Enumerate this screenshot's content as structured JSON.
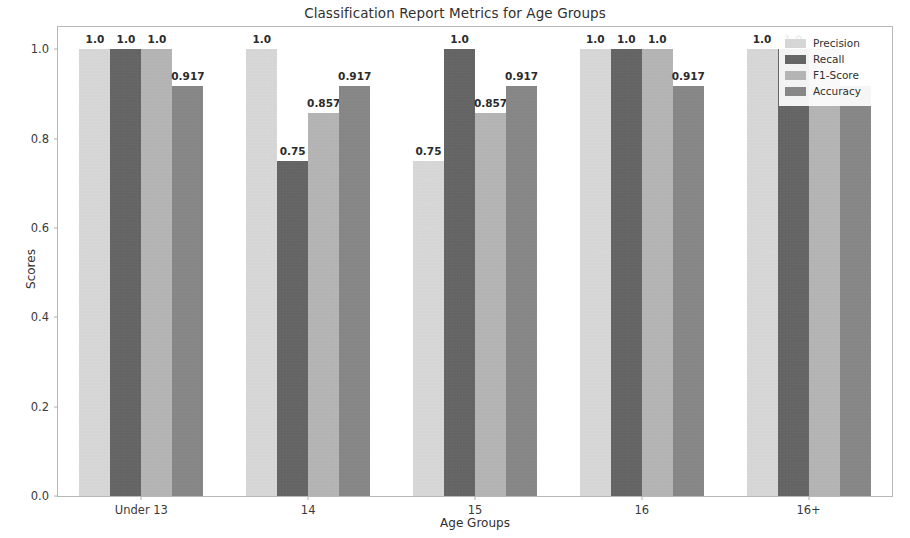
{
  "chart_data": {
    "type": "bar",
    "title": "Classification Report Metrics for Age Groups",
    "xlabel": "Age Groups",
    "ylabel": "Scores",
    "categories": [
      "Under 13",
      "14",
      "15",
      "16",
      "16+"
    ],
    "ylim": [
      0.0,
      1.05
    ],
    "yticks": [
      "0.0",
      "0.2",
      "0.4",
      "0.6",
      "0.8",
      "1.0"
    ],
    "ytick_values": [
      0.0,
      0.2,
      0.4,
      0.6,
      0.8,
      1.0
    ],
    "grid": false,
    "legend_position": "upper right",
    "series": [
      {
        "name": "Precision",
        "color": "#dcdcdc",
        "values": [
          1.0,
          1.0,
          0.75,
          1.0,
          1.0
        ],
        "labels": [
          "1.0",
          "1.0",
          "0.75",
          "1.0",
          "1.0"
        ]
      },
      {
        "name": "Recall",
        "color": "#595959",
        "values": [
          1.0,
          0.75,
          1.0,
          1.0,
          1.0
        ],
        "labels": [
          "1.0",
          "0.75",
          "1.0",
          "1.0",
          "1.0"
        ]
      },
      {
        "name": "F1-Score",
        "color": "#b4b4b4",
        "values": [
          1.0,
          0.857,
          0.857,
          1.0,
          1.0
        ],
        "labels": [
          "1.0",
          "0.857",
          "0.857",
          "1.0",
          ""
        ]
      },
      {
        "name": "Accuracy",
        "color": "#808080",
        "values": [
          0.917,
          0.917,
          0.917,
          0.917,
          0.917
        ],
        "labels": [
          "0.917",
          "0.917",
          "0.917",
          "0.917",
          ""
        ]
      }
    ]
  }
}
